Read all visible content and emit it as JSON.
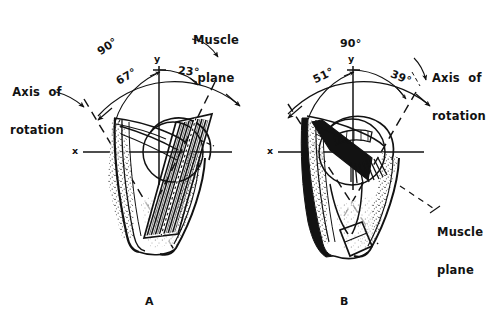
{
  "figure": {
    "type": "anatomical-line-drawing",
    "background_color": "#ffffff",
    "ink_color": "#121212",
    "panels": [
      {
        "id": "A",
        "panel_label": "A",
        "axis_labels": {
          "x": "x",
          "y": "y"
        },
        "callouts": [
          {
            "name": "axis-of-rotation",
            "line1": "Axis  of",
            "line2": "rotation"
          },
          {
            "name": "muscle-plane",
            "line1": "Muscle",
            "line2": "plane"
          }
        ],
        "angles": [
          {
            "name": "total-angle",
            "value": "90°"
          },
          {
            "name": "axis-to-y-angle",
            "value": "67°"
          },
          {
            "name": "y-to-muscle-plane-angle",
            "value": "23°"
          }
        ]
      },
      {
        "id": "B",
        "panel_label": "B",
        "axis_labels": {
          "x": "x",
          "y": "y"
        },
        "callouts": [
          {
            "name": "axis-of-rotation",
            "line1": "Axis  of",
            "line2": "rotation"
          },
          {
            "name": "muscle-plane",
            "line1": "Muscle",
            "line2": "plane"
          }
        ],
        "angles": [
          {
            "name": "total-angle",
            "value": "90°"
          },
          {
            "name": "muscle-plane-to-y-angle",
            "value": "51°"
          },
          {
            "name": "y-to-axis-angle",
            "value": "39°"
          }
        ]
      }
    ]
  },
  "panelA": {
    "angle_total": "90°",
    "angle_left": "67°",
    "angle_right": "23°",
    "x_label": "x",
    "y_label": "y",
    "axis_line1": "Axis  of",
    "axis_line2": "rotation",
    "muscle_line1": "Muscle",
    "muscle_line2": "plane",
    "panel_label": "A"
  },
  "panelB": {
    "angle_total": "90°",
    "angle_left": "51°",
    "angle_right": "39°",
    "x_label": "x",
    "y_label": "y",
    "axis_line1": "Axis  of",
    "axis_line2": "rotation",
    "muscle_line1": "Muscle",
    "muscle_line2": "plane",
    "panel_label": "B"
  }
}
